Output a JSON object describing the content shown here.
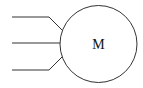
{
  "diagram": {
    "type": "three-phase motor symbol",
    "motor": {
      "label": "M",
      "cx": 98.5,
      "cy": 44,
      "r": 38.5
    },
    "wires": [
      {
        "name": "phase-1",
        "points": "12,17 49,17 62,30"
      },
      {
        "name": "phase-2",
        "points": "12,43 60,43"
      },
      {
        "name": "phase-3",
        "points": "12,70 49,70 62,57"
      }
    ],
    "colors": {
      "stroke": "#333333",
      "background": "#ffffff"
    }
  }
}
